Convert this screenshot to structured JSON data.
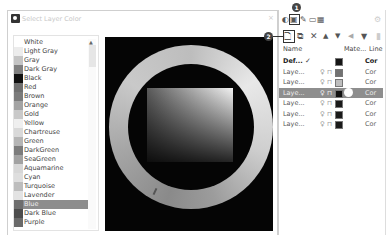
{
  "dialog": {
    "title": "Select Layer Color",
    "close_glyph": "×"
  },
  "color_list": {
    "items": [
      {
        "label": "White",
        "color": "#ffffff"
      },
      {
        "label": "Light Gray",
        "color": "#ececec"
      },
      {
        "label": "Gray",
        "color": "#c4c4c4"
      },
      {
        "label": "Dark Gray",
        "color": "#808080"
      },
      {
        "label": "Black",
        "color": "#111111"
      },
      {
        "label": "Red",
        "color": "#6f6f6f"
      },
      {
        "label": "Brown",
        "color": "#7b7b7b"
      },
      {
        "label": "Orange",
        "color": "#a3a3a3"
      },
      {
        "label": "Gold",
        "color": "#c9c9c9"
      },
      {
        "label": "Yellow",
        "color": "#efefef"
      },
      {
        "label": "Chartreuse",
        "color": "#d9d9d9"
      },
      {
        "label": "Green",
        "color": "#b5b5b5"
      },
      {
        "label": "DarkGreen",
        "color": "#7c7c7c"
      },
      {
        "label": "SeaGreen",
        "color": "#a2a2a2"
      },
      {
        "label": "Aquamarine",
        "color": "#d7d7d7"
      },
      {
        "label": "Cyan",
        "color": "#dedede"
      },
      {
        "label": "Turquoise",
        "color": "#bdbdbd"
      },
      {
        "label": "Lavender",
        "color": "#e3e3e3"
      },
      {
        "label": "Blue",
        "color": "#6e6e6e",
        "selected": true
      },
      {
        "label": "Dark Blue",
        "color": "#4d4d4d"
      },
      {
        "label": "Purple",
        "color": "#6a6a6a"
      }
    ],
    "scroll_up_glyph": "▲"
  },
  "color_wheel": {
    "background": "#050505"
  },
  "layers_panel": {
    "toolbar_top": {
      "icons": [
        "layers-icon",
        "layer-color-icon",
        "pen-icon",
        "folder-icon",
        "image-icon",
        "settings-icon"
      ],
      "glyphs": [
        "◐",
        "▣",
        "✎",
        "▭",
        "▦",
        "⚙"
      ]
    },
    "toolbar_main": {
      "new_layer": "🗋",
      "new_sublayer": "⧉",
      "delete": "✕",
      "move_up": "▲",
      "move_down": "▼",
      "collapse": "◀",
      "filter": "▼",
      "more": "▮"
    },
    "callouts": {
      "one": "1",
      "two": "2"
    },
    "columns": {
      "name": "Name",
      "material": "Mate...",
      "linetype": "Line"
    },
    "rows": [
      {
        "name": "Def...",
        "current": "✓",
        "swatch": "#151515",
        "linetype": "Cor",
        "bold": true,
        "show_icons": false
      },
      {
        "name": "Laye...",
        "swatch": "#727272",
        "linetype": "Cor",
        "show_icons": true
      },
      {
        "name": "Laye...",
        "swatch": "#bdbdbd",
        "linetype": "Cor",
        "show_icons": true
      },
      {
        "name": "Laye...",
        "swatch": "#111111",
        "linetype": "Cor",
        "show_icons": true,
        "selected": true
      },
      {
        "name": "Laye...",
        "swatch": "#1a1a1a",
        "linetype": "Cor",
        "show_icons": true
      },
      {
        "name": "Laye...",
        "swatch": "#1a1a1a",
        "linetype": "Cor",
        "show_icons": true
      },
      {
        "name": "Laye...",
        "swatch": "#1a1a1a",
        "linetype": "Cor",
        "show_icons": true
      }
    ],
    "bulb_glyph": "♀",
    "lock_glyph": "⊓"
  }
}
